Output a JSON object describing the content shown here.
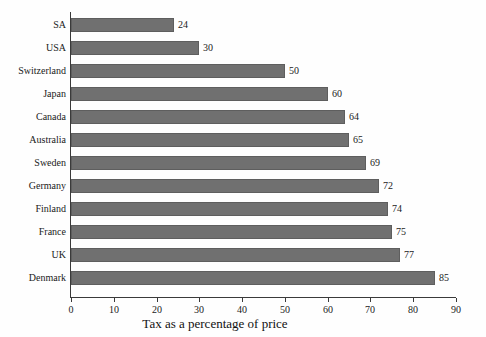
{
  "chart_data": {
    "type": "bar",
    "orientation": "horizontal",
    "title": "",
    "xlabel": "Tax as a percentage of price",
    "ylabel": "",
    "xlim": [
      0,
      90
    ],
    "xticks": [
      0,
      10,
      20,
      30,
      40,
      50,
      60,
      70,
      80,
      90
    ],
    "grid": false,
    "legend": false,
    "bar_color": "#707070",
    "bar_edge_color": "#5e5e5e",
    "axis_color": "#3a3a3a",
    "background": "#fefefe",
    "categories": [
      "SA",
      "USA",
      "Switzerland",
      "Japan",
      "Canada",
      "Australia",
      "Sweden",
      "Germany",
      "Finland",
      "France",
      "UK",
      "Denmark"
    ],
    "values": [
      24,
      30,
      50,
      60,
      64,
      65,
      69,
      72,
      74,
      75,
      77,
      85
    ],
    "value_labels": [
      "24",
      "30",
      "50",
      "60",
      "64",
      "65",
      "69",
      "72",
      "74",
      "75",
      "77",
      "85"
    ],
    "xtick_labels": [
      "0",
      "10",
      "20",
      "30",
      "40",
      "50",
      "60",
      "70",
      "80",
      "90"
    ]
  }
}
